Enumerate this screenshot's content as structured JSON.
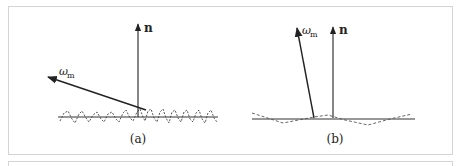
{
  "figure": {
    "panels": [
      {
        "id": "a",
        "caption": "(a)",
        "normal_label": "n",
        "microfacet_label": "ω",
        "microfacet_subscript": "m",
        "surface": "rough (high-frequency microsurface)"
      },
      {
        "id": "b",
        "caption": "(b)",
        "normal_label": "n",
        "microfacet_label": "ω",
        "microfacet_subscript": "m",
        "surface": "smooth (low-frequency microsurface)"
      }
    ],
    "colors": {
      "line": "#222222",
      "border": "#d4d4d4",
      "dashed": "#555555"
    }
  }
}
